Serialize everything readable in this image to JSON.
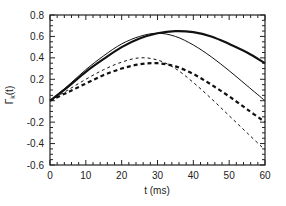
{
  "chart_data": {
    "type": "line",
    "title": "",
    "xlabel": "t (ms)",
    "ylabel": "Γ_k(t)",
    "ylabel_main": "Γ",
    "ylabel_sub": "k",
    "ylabel_suffix": "(t)",
    "xlim": [
      0,
      60
    ],
    "ylim": [
      -0.6,
      0.8
    ],
    "xticks": [
      0,
      10,
      20,
      30,
      40,
      50,
      60
    ],
    "xtick_labels": [
      "0",
      "10",
      "20",
      "30",
      "40",
      "50",
      "60"
    ],
    "yticks": [
      0.8,
      0.6,
      0.4,
      0.2,
      0,
      -0.2,
      -0.4,
      -0.6
    ],
    "ytick_labels": [
      "0.8",
      "0.6",
      "0.4",
      "0.2",
      "0",
      "-0.2",
      "-0.4",
      "-0.6"
    ],
    "grid": false,
    "legend": null,
    "x": [
      0,
      5,
      10,
      15,
      20,
      25,
      30,
      35,
      40,
      45,
      50,
      55,
      60
    ],
    "series": [
      {
        "name": "thick solid",
        "style": "solid",
        "width": 2.2,
        "values": [
          0,
          0.13,
          0.27,
          0.39,
          0.5,
          0.58,
          0.63,
          0.65,
          0.64,
          0.6,
          0.53,
          0.45,
          0.35
        ]
      },
      {
        "name": "thin solid",
        "style": "solid",
        "width": 1.0,
        "values": [
          0,
          0.14,
          0.29,
          0.42,
          0.53,
          0.6,
          0.63,
          0.6,
          0.52,
          0.41,
          0.28,
          0.14,
          0.0
        ]
      },
      {
        "name": "thin dashed",
        "style": "dashed",
        "width": 1.0,
        "values": [
          0,
          0.1,
          0.2,
          0.29,
          0.36,
          0.4,
          0.38,
          0.3,
          0.17,
          0.02,
          -0.14,
          -0.3,
          -0.46
        ]
      },
      {
        "name": "thick dashed",
        "style": "dashed",
        "width": 2.2,
        "values": [
          0,
          0.08,
          0.16,
          0.24,
          0.3,
          0.34,
          0.35,
          0.32,
          0.25,
          0.15,
          0.04,
          -0.08,
          -0.2
        ]
      }
    ]
  }
}
